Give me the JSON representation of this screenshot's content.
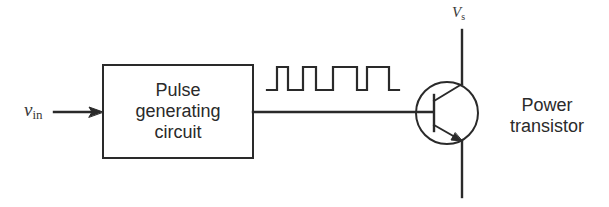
{
  "diagram": {
    "type": "block-diagram",
    "input": {
      "symbol": "v",
      "subscript": "in"
    },
    "block": {
      "lines": [
        "Pulse",
        "generating",
        "circuit"
      ]
    },
    "signal": {
      "shape": "square-pulse-train",
      "pulse_count": 4
    },
    "transistor": {
      "type": "NPN",
      "label_lines": [
        "Power",
        "transistor"
      ],
      "supply": {
        "symbol": "V",
        "subscript": "s"
      }
    },
    "colors": {
      "stroke": "#2a2a2a",
      "background": "#ffffff"
    }
  }
}
